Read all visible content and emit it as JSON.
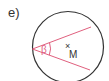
{
  "figure": {
    "label": "e)",
    "angle_label": "β",
    "point_label": "M",
    "point_marker": "×",
    "colors": {
      "circle": "#333333",
      "chords": "#e0607e",
      "text": "#333333"
    }
  }
}
